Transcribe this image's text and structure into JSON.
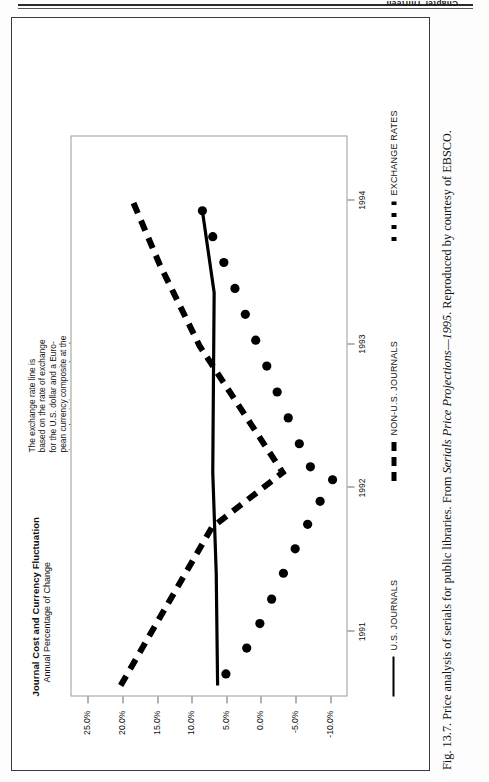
{
  "page": {
    "running_head": "Chapter Thirteen"
  },
  "figure": {
    "caption_prefix": "Fig. 13.7.",
    "caption_text_1": "Price analysis of serials for public libraries. From",
    "caption_italic": "Serials Price Projections—1995",
    "caption_text_2": ". Reproduced by courtesy of EBSCO."
  },
  "chart": {
    "title": "Journal Cost and Currency Fluctuation",
    "subtitle": "Annual Percentage of Change",
    "annotation": "The exchange rate line is\nbased on the rate of exchange\nfor the U.S. dollar and a Euro-\npean currency composite at the\ntime subscriptions were bought\nfor each year shown. The cur-\nrency composite is an average\nof values for the British pound,\nDutch guilder, German mark,\nFrench franc and Swiss franc.\nEach point on the exchange\nrate line represents the change\nin the currency composite's\nvalue as compared to the U.S.\ndollar (i.e., the change in how\nmany dollars can be bought by\na unit of the currency compos-\nite from one year to the next).\nWhen the line slopes down-\nward, the U.S. dollar is stronger."
  },
  "legend": {
    "items": [
      {
        "label": "U.S. JOURNALS",
        "style": "solid"
      },
      {
        "label": "NON-U.S. JOURNALS",
        "style": "dashed"
      },
      {
        "label": "EXCHANGE RATES",
        "style": "dotted"
      }
    ]
  },
  "chart_data": {
    "type": "line",
    "title": "Journal Cost and Currency Fluctuation",
    "subtitle": "Annual Percentage of Change",
    "xlabel": "",
    "ylabel": "Annual Percentage of Change",
    "ylim": [
      -12.5,
      27.5
    ],
    "xlim": [
      1990.55,
      1994.45
    ],
    "grid": false,
    "legend_position": "bottom",
    "yticks": [
      25.0,
      20.0,
      15.0,
      10.0,
      5.0,
      0.0,
      -5.0,
      -10.0
    ],
    "ytick_labels": [
      "25.0%",
      "20.0%",
      "15.0%",
      "10.0%",
      "5.0%",
      "0.0%",
      "-5.0%",
      "-10.0%"
    ],
    "xticks": [
      1991,
      1992,
      1993,
      1994
    ],
    "xtick_labels": [
      "1991",
      "1992",
      "1993",
      "1994"
    ],
    "series": [
      {
        "name": "U.S. JOURNALS",
        "style": "solid",
        "x": [
          1990.62,
          1991.4,
          1992.1,
          1992.75,
          1993.35,
          1993.92
        ],
        "values": [
          6.4,
          6.6,
          7.1,
          7.0,
          6.9,
          8.6
        ]
      },
      {
        "name": "NON-U.S. JOURNALS",
        "style": "dashed",
        "x": [
          1990.62,
          1991.72,
          1992.1,
          1992.98,
          1993.55,
          1993.98
        ],
        "values": [
          20.4,
          7.2,
          -3.0,
          9.0,
          14.8,
          18.6
        ]
      },
      {
        "name": "EXCHANGE RATES",
        "style": "dotted-markers",
        "x": [
          1990.7,
          1990.88,
          1991.05,
          1991.22,
          1991.4,
          1991.57,
          1991.74,
          1991.9,
          1992.05,
          1992.14,
          1992.3,
          1992.48,
          1992.66,
          1992.84,
          1993.02,
          1993.2,
          1993.38,
          1993.56,
          1993.74,
          1993.92
        ],
        "values": [
          5.2,
          2.2,
          0.3,
          -1.4,
          -3.1,
          -4.8,
          -6.6,
          -8.4,
          -10.2,
          -7.0,
          -5.4,
          -3.8,
          -2.2,
          -0.7,
          0.9,
          2.4,
          3.9,
          5.5,
          7.1,
          8.6
        ]
      }
    ]
  }
}
